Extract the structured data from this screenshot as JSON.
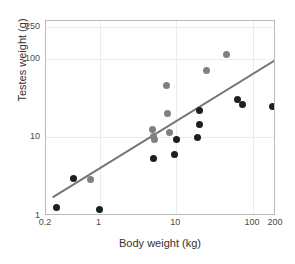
{
  "chart_data": {
    "type": "scatter",
    "title": "",
    "xlabel": "Body weight (kg)",
    "ylabel": "Testes weight (g)",
    "xscale": "log",
    "yscale": "log",
    "xlim": [
      0.2,
      200
    ],
    "ylim": [
      1,
      300
    ],
    "xticks": [
      0.2,
      1,
      10,
      100,
      200
    ],
    "xticklabels": [
      "0.2",
      "1",
      "10",
      "100",
      "200"
    ],
    "yticks": [
      1,
      10,
      100,
      250
    ],
    "yticklabels": [
      "1",
      "10",
      "100",
      "250"
    ],
    "grid": true,
    "legend": "none",
    "colors": {
      "dark_points": "#1f1f1f",
      "gray_points": "#808080",
      "trendline": "#757575",
      "gridline": "#ececec",
      "frame": "#b9b9b9"
    },
    "series": [
      {
        "name": "dark",
        "color": "#1f1f1f",
        "points": [
          {
            "x": 0.27,
            "y": 1.3
          },
          {
            "x": 0.45,
            "y": 3.0
          },
          {
            "x": 1.0,
            "y": 1.2
          },
          {
            "x": 5.0,
            "y": 5.4
          },
          {
            "x": 9.6,
            "y": 6.0
          },
          {
            "x": 10.0,
            "y": 9.4
          },
          {
            "x": 19.0,
            "y": 10.0
          },
          {
            "x": 20.0,
            "y": 14.5
          },
          {
            "x": 20.0,
            "y": 22.0
          },
          {
            "x": 63.0,
            "y": 30.0
          },
          {
            "x": 74.0,
            "y": 26.5
          },
          {
            "x": 180.0,
            "y": 25.0
          }
        ]
      },
      {
        "name": "gray",
        "color": "#808080",
        "points": [
          {
            "x": 0.75,
            "y": 2.9
          },
          {
            "x": 4.9,
            "y": 12.5
          },
          {
            "x": 5.1,
            "y": 10.2
          },
          {
            "x": 5.2,
            "y": 9.3
          },
          {
            "x": 7.4,
            "y": 45.0
          },
          {
            "x": 7.7,
            "y": 20.0
          },
          {
            "x": 8.2,
            "y": 11.5
          },
          {
            "x": 25.0,
            "y": 70.0
          },
          {
            "x": 45.0,
            "y": 112.0
          }
        ]
      }
    ],
    "trendline": {
      "type": "linear-on-log-log",
      "x_start": 0.25,
      "y_start": 1.75,
      "x_end": 200,
      "y_end": 97
    }
  },
  "axes": {
    "xlabel": "Body weight (kg)",
    "ylabel": "Testes weight (g)"
  }
}
